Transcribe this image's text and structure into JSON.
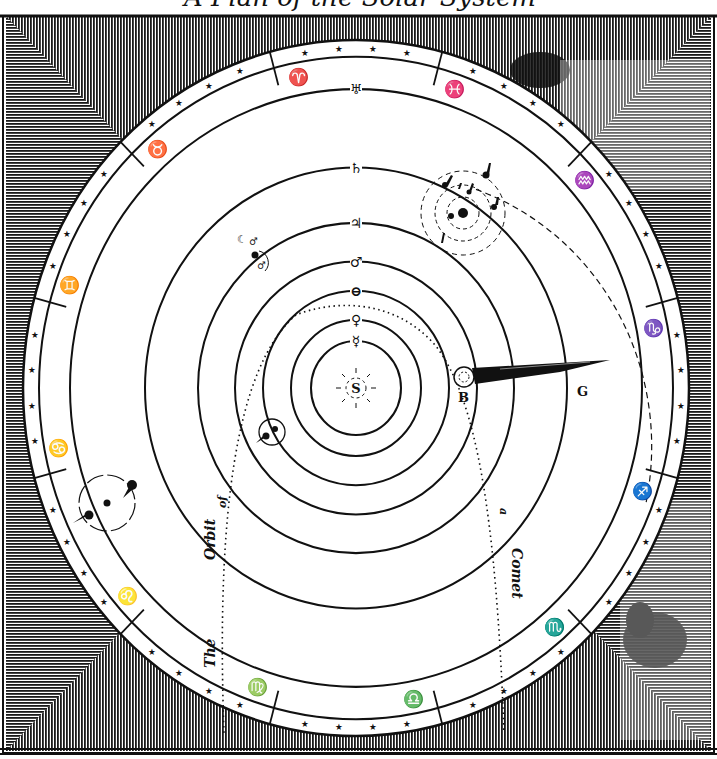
{
  "title": {
    "text": "A Plan of the Solar System",
    "visible_fragment": "partially cropped at top edge"
  },
  "diagram": {
    "type": "heliocentric solar system engraving",
    "colors": {
      "ink": "#111111",
      "paper": "#ffffff",
      "hatch_bg": "#2a2a2a"
    },
    "center": {
      "x": 356,
      "y": 388
    },
    "sun": {
      "label": "S",
      "symbol": "sun-icon"
    },
    "orbits": [
      {
        "name": "Mercury",
        "symbol": "☿",
        "r": 45
      },
      {
        "name": "Venus",
        "symbol": "♀",
        "r": 65
      },
      {
        "name": "Earth",
        "symbol": "⊖",
        "r": 93
      },
      {
        "name": "Mars",
        "symbol": "♂",
        "r": 121
      },
      {
        "name": "Jupiter",
        "symbol": "♃",
        "r": 158
      },
      {
        "name": "Saturn",
        "symbol": "♄",
        "r": 211
      },
      {
        "name": "Herschel",
        "symbol": "♅",
        "r": 286
      }
    ],
    "comet": {
      "head_label": "B",
      "tail_label": "G",
      "orbit_caption": [
        "The",
        "Orbit",
        "of",
        "a",
        "Comet"
      ]
    },
    "zodiac": [
      {
        "name": "Taurus",
        "glyph": "♉"
      },
      {
        "name": "Aries",
        "glyph": "♈"
      },
      {
        "name": "Pisces",
        "glyph": "♓"
      },
      {
        "name": "Aquarius",
        "glyph": "♒"
      },
      {
        "name": "Capricorn",
        "glyph": "♑"
      },
      {
        "name": "Sagittarius",
        "glyph": "♐"
      },
      {
        "name": "Scorpio",
        "glyph": "♏"
      },
      {
        "name": "Libra",
        "glyph": "♎"
      },
      {
        "name": "Virgo",
        "glyph": "♍"
      },
      {
        "name": "Leo",
        "glyph": "♌"
      },
      {
        "name": "Cancer",
        "glyph": "♋"
      },
      {
        "name": "Gemini",
        "glyph": "♊"
      }
    ],
    "moons": {
      "earth": "Moon",
      "jupiter": "4 satellites",
      "saturn": "7 satellites",
      "herschel": "2 satellites"
    }
  }
}
